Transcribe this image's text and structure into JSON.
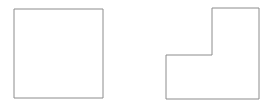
{
  "canvas": {
    "width": 268,
    "height": 109,
    "background_color": "#ffffff",
    "description": "Two outlined geometric figures side by side on a plain white background: a square on the left and an L-shaped hexagon (square with a notch cut out of its upper-left) on the right."
  },
  "style": {
    "stroke_color": "#8c8c8c",
    "stroke_width": 1,
    "fill_color": "#ffffff"
  },
  "shapes": [
    {
      "id": "square",
      "name": "square-shape",
      "kind": "rect",
      "label": "",
      "x": 14,
      "y": 9,
      "width": 89,
      "height": 89,
      "points": "14,9 103,9 103,98 14,98"
    },
    {
      "id": "l-shape",
      "name": "l-shape",
      "kind": "polygon",
      "label": "",
      "points": "166,55 212,55 212,8 259,8 259,99 166,99",
      "vertices": [
        {
          "x": 166,
          "y": 55
        },
        {
          "x": 212,
          "y": 55
        },
        {
          "x": 212,
          "y": 8
        },
        {
          "x": 259,
          "y": 8
        },
        {
          "x": 259,
          "y": 99
        },
        {
          "x": 166,
          "y": 99
        }
      ]
    }
  ]
}
